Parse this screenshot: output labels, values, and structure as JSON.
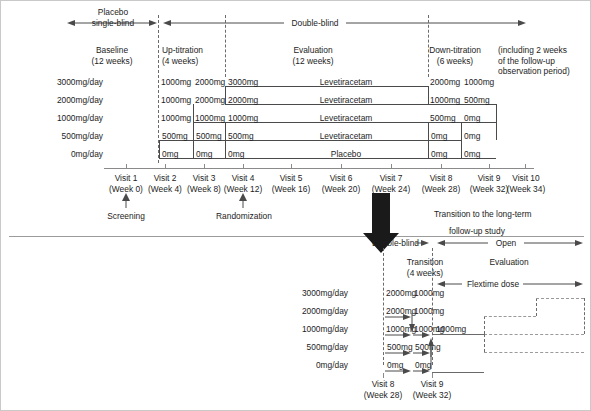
{
  "figure": {
    "upper_study": {
      "phase_bars": [
        {
          "id": "placebo-single-blind",
          "label": "Placebo\nsingle-blind"
        },
        {
          "id": "double-blind",
          "label": "Double-blind"
        }
      ],
      "placebo_label_line1": "Placebo",
      "placebo_label_line2": "single-blind",
      "double_blind_label": "Double-blind",
      "periods": [
        {
          "name": "Baseline",
          "duration": "(12 weeks)"
        },
        {
          "name": "Up-titration",
          "duration": "(4 weeks)"
        },
        {
          "name": "Evaluation",
          "duration": "(12 weeks)"
        },
        {
          "name": "Down-titration",
          "duration": "(6 weeks)"
        }
      ],
      "note": {
        "line1": "(including 2 weeks",
        "line2": "of the follow-up",
        "line3": "observation period)"
      },
      "dose_rows": [
        {
          "dose_label": "3000mg/day",
          "up_titration": [
            "1000mg",
            "2000mg"
          ],
          "evaluation_dose": "3000mg",
          "treatment": "Levetiracetam",
          "down_titration": [
            "2000mg",
            "1000mg"
          ]
        },
        {
          "dose_label": "2000mg/day",
          "up_titration": [
            "1000mg",
            "2000mg"
          ],
          "evaluation_dose": "2000mg",
          "treatment": "Levetiracetam",
          "down_titration": [
            "1000mg",
            "500mg"
          ]
        },
        {
          "dose_label": "1000mg/day",
          "up_titration": [
            "1000mg",
            "1000mg"
          ],
          "evaluation_dose": "1000mg",
          "treatment": "Levetiracetam",
          "down_titration": [
            "500mg",
            "0mg"
          ]
        },
        {
          "dose_label": "500mg/day",
          "up_titration": [
            "500mg",
            "500mg"
          ],
          "evaluation_dose": "500mg",
          "treatment": "Levetiracetam",
          "down_titration": [
            "0mg",
            "0mg"
          ]
        },
        {
          "dose_label": "0mg/day",
          "up_titration": [
            "0mg",
            "0mg"
          ],
          "evaluation_dose": "0mg",
          "treatment": "Placebo",
          "down_titration": [
            "0mg",
            "0mg"
          ]
        }
      ],
      "visits": [
        {
          "name": "Visit 1",
          "week": "(Week 0)"
        },
        {
          "name": "Visit 2",
          "week": "(Week 4)"
        },
        {
          "name": "Visit 3",
          "week": "(Week 8)"
        },
        {
          "name": "Visit 4",
          "week": "(Week 12)"
        },
        {
          "name": "Visit 5",
          "week": "(Week 16)"
        },
        {
          "name": "Visit 6",
          "week": "(Week 20)"
        },
        {
          "name": "Visit 7",
          "week": "(Week 24)"
        },
        {
          "name": "Visit 8",
          "week": "(Week 28)"
        },
        {
          "name": "Visit 9",
          "week": "(Week 32)"
        },
        {
          "name": "Visit 10",
          "week": "(Week 34)"
        }
      ],
      "annotations": [
        {
          "id": "screening",
          "label": "Screening"
        },
        {
          "id": "randomization",
          "label": "Randomization"
        }
      ]
    },
    "transition": {
      "caption_line1": "Transition to the long-term",
      "caption_line2": "follow-up study"
    },
    "lower_study": {
      "phase_bars": [
        {
          "id": "double-blind",
          "label": "Double-blind"
        },
        {
          "id": "open",
          "label": "Open"
        }
      ],
      "double_blind_label": "Double-blind",
      "open_label": "Open",
      "periods": [
        {
          "name": "Transition",
          "duration": "(4 weeks)"
        },
        {
          "name": "Evaluation",
          "duration": ""
        }
      ],
      "flextime_label": "Flextime dose",
      "dose_rows": [
        {
          "dose_label": "3000mg/day",
          "col1": "2000mg",
          "col2": "1000mg",
          "open_dose": ""
        },
        {
          "dose_label": "2000mg/day",
          "col1": "2000mg",
          "col2": "1000mg",
          "open_dose": ""
        },
        {
          "dose_label": "1000mg/day",
          "col1": "1000mg",
          "col2": "1000mg",
          "open_dose": "1000mg"
        },
        {
          "dose_label": "500mg/day",
          "col1": "500mg",
          "col2": "500mg",
          "open_dose": ""
        },
        {
          "dose_label": "0mg/day",
          "col1": "0mg",
          "col2": "0mg",
          "open_dose": ""
        }
      ],
      "visits": [
        {
          "name": "Visit 8",
          "week": "(Week 28)"
        },
        {
          "name": "Visit 9",
          "week": "(Week 32)"
        }
      ]
    }
  }
}
